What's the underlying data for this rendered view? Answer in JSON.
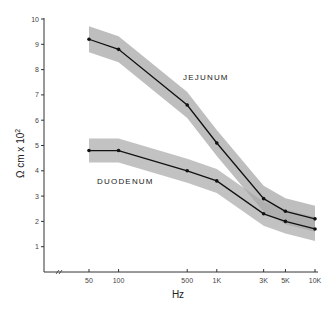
{
  "chart_data": {
    "type": "line",
    "title": "",
    "xlabel": "Hz",
    "ylabel": "Ω cm x 10²",
    "x_scale": "log",
    "x": [
      50,
      100,
      500,
      1000,
      3000,
      5000,
      10000
    ],
    "x_tick_labels": [
      "50",
      "100",
      "500",
      "1K",
      "3K",
      "5K",
      "10K"
    ],
    "y_ticks": [
      1,
      2,
      3,
      4,
      5,
      6,
      7,
      8,
      9,
      10
    ],
    "ylim": [
      0,
      10
    ],
    "grid": false,
    "legend": "inline labels",
    "axis_break": "x-axis break marks near origin",
    "series": [
      {
        "name": "JEJUNUM",
        "values": [
          9.2,
          8.8,
          6.6,
          5.1,
          2.9,
          2.4,
          2.1
        ],
        "band": "shaded ± range"
      },
      {
        "name": "DUODENUM",
        "values": [
          4.8,
          4.8,
          4.0,
          3.6,
          2.3,
          2.0,
          1.7
        ],
        "band": "shaded ± range"
      }
    ]
  },
  "labels": {
    "ylabel": "Ω cm x 10",
    "ylabel_exp": "2",
    "xlabel": "Hz",
    "jejunum": "JEJUNUM",
    "duodenum": "DUODENUM"
  }
}
